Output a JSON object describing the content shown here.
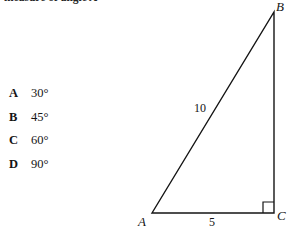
{
  "prompt": {
    "text": "measure of angle A"
  },
  "choices": [
    {
      "letter": "A",
      "value": "30°"
    },
    {
      "letter": "B",
      "value": "45°"
    },
    {
      "letter": "C",
      "value": "60°"
    },
    {
      "letter": "D",
      "value": "90°"
    }
  ],
  "figure": {
    "type": "right-triangle",
    "vertices": {
      "A": {
        "label": "A",
        "x": 152,
        "y": 213
      },
      "B": {
        "label": "B",
        "x": 274,
        "y": 12
      },
      "C": {
        "label": "C",
        "x": 274,
        "y": 213
      }
    },
    "side_labels": {
      "hypotenuse": "10",
      "base": "5"
    },
    "right_angle_at": "C",
    "stroke_color": "#141414",
    "stroke_width": 1.4
  }
}
